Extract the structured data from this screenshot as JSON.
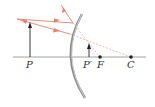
{
  "diagram": {
    "type": "convex-mirror-ray-diagram",
    "labels": {
      "object": "P",
      "image": "P′",
      "focal_point": "F",
      "center_of_curvature": "C"
    },
    "colors": {
      "ray": "#e8806a",
      "ray_dashed": "#eda89a",
      "axis": "#8a8a8a",
      "mirror": "#7d7d7d",
      "arrow": "#222222",
      "point": "#222222"
    }
  }
}
